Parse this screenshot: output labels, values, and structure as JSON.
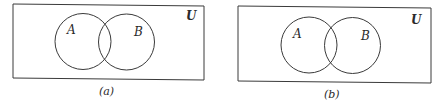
{
  "figure": {
    "stroke_color": "#3a3a3a",
    "panels": [
      {
        "id": "a",
        "caption": "(a)",
        "universe_label": "U",
        "rect": {
          "x": 13,
          "y": 4,
          "w": 191,
          "h": 75,
          "skew": 1.5
        },
        "sets": [
          {
            "label": "A",
            "cx": 83,
            "cy": 41.5,
            "r": 28,
            "label_x": 67,
            "label_y": 34
          },
          {
            "label": "B",
            "cx": 126.5,
            "cy": 42,
            "r": 28,
            "label_x": 134,
            "label_y": 36
          }
        ],
        "universe_pos": {
          "x": 186,
          "y": 20
        },
        "caption_pos": {
          "x": 102,
          "y": 94
        }
      },
      {
        "id": "b",
        "caption": "(b)",
        "universe_label": "U",
        "rect": {
          "x": 238,
          "y": 6,
          "w": 193,
          "h": 76,
          "skew": 1.5
        },
        "sets": [
          {
            "label": "A",
            "cx": 309,
            "cy": 45,
            "r": 28,
            "label_x": 293,
            "label_y": 37
          },
          {
            "label": "B",
            "cx": 352.5,
            "cy": 45.5,
            "r": 28,
            "label_x": 361,
            "label_y": 39
          }
        ],
        "universe_pos": {
          "x": 411,
          "y": 24
        },
        "caption_pos": {
          "x": 327,
          "y": 97
        }
      }
    ]
  }
}
